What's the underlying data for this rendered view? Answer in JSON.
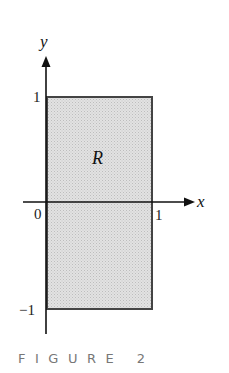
{
  "figure": {
    "caption": "FIGURE 2",
    "region_label": "R",
    "axes": {
      "x_label": "x",
      "y_label": "y",
      "x_ticks": [
        {
          "value": 0,
          "label": "0"
        },
        {
          "value": 1,
          "label": "1"
        }
      ],
      "y_ticks": [
        {
          "value": 1,
          "label": "1"
        },
        {
          "value": -1,
          "label": "−1"
        }
      ]
    },
    "region": {
      "x_range": [
        0,
        1
      ],
      "y_range": [
        -1,
        1
      ],
      "fill_color": "#d6d6d6",
      "border_color": "#444444"
    },
    "colors": {
      "axis": "#111111",
      "caption": "#777777"
    }
  }
}
